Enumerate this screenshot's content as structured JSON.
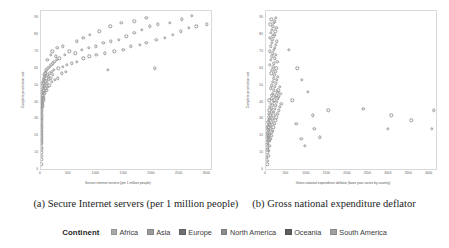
{
  "figure": {
    "captions": [
      "(a) Secure Internet servers (per 1 million people)",
      "(b) Gross national expenditure deflator"
    ]
  },
  "legend": {
    "title": "Continent",
    "items": [
      {
        "label": "Africa",
        "color": "#a9a9a9"
      },
      {
        "label": "Asia",
        "color": "#9b9b9b"
      },
      {
        "label": "Europe",
        "color": "#6f6f6f"
      },
      {
        "label": "North America",
        "color": "#8c8c8c"
      },
      {
        "label": "Oceania",
        "color": "#5e5e5e"
      },
      {
        "label": "South America",
        "color": "#a0a0a0"
      }
    ]
  },
  "chart_data": [
    {
      "type": "scatter",
      "panel": "a",
      "title": "",
      "xlabel": "Secure internet servers (per 1 million people)",
      "ylabel": "Complete penetration rate",
      "xlim": [
        0,
        3100
      ],
      "ylim": [
        0,
        95
      ],
      "xticks": [
        0,
        500,
        1000,
        1500,
        2000,
        2500,
        3000
      ],
      "xticklabels": [
        "0",
        "500",
        "1000",
        "1500",
        "2000",
        "2500",
        "3000"
      ],
      "yticks": [
        0,
        10,
        20,
        30,
        40,
        50,
        60,
        70,
        80,
        90
      ],
      "yticklabels": [
        "0",
        "10",
        "20",
        "30",
        "40",
        "50",
        "60",
        "70",
        "80",
        "90"
      ],
      "grid": false,
      "marker": "open-circle",
      "points": [
        [
          5,
          4
        ],
        [
          5,
          7
        ],
        [
          5,
          9
        ],
        [
          6,
          11
        ],
        [
          5,
          13
        ],
        [
          7,
          14
        ],
        [
          6,
          16
        ],
        [
          8,
          17
        ],
        [
          5,
          18
        ],
        [
          9,
          19
        ],
        [
          7,
          20
        ],
        [
          6,
          21
        ],
        [
          10,
          22
        ],
        [
          8,
          23
        ],
        [
          12,
          24
        ],
        [
          7,
          25
        ],
        [
          11,
          26
        ],
        [
          9,
          27
        ],
        [
          14,
          28
        ],
        [
          8,
          29
        ],
        [
          13,
          30
        ],
        [
          10,
          31
        ],
        [
          16,
          32
        ],
        [
          12,
          33
        ],
        [
          9,
          34
        ],
        [
          18,
          35
        ],
        [
          14,
          36
        ],
        [
          11,
          37
        ],
        [
          20,
          38
        ],
        [
          15,
          38
        ],
        [
          24,
          39
        ],
        [
          13,
          40
        ],
        [
          28,
          40
        ],
        [
          18,
          41
        ],
        [
          34,
          41
        ],
        [
          16,
          42
        ],
        [
          40,
          42
        ],
        [
          22,
          43
        ],
        [
          46,
          43
        ],
        [
          19,
          44
        ],
        [
          52,
          44
        ],
        [
          26,
          45
        ],
        [
          30,
          46
        ],
        [
          60,
          46
        ],
        [
          24,
          47
        ],
        [
          70,
          47
        ],
        [
          38,
          48
        ],
        [
          100,
          48
        ],
        [
          33,
          49
        ],
        [
          86,
          49
        ],
        [
          46,
          50
        ],
        [
          120,
          50
        ],
        [
          28,
          51
        ],
        [
          64,
          51
        ],
        [
          150,
          51
        ],
        [
          42,
          52
        ],
        [
          108,
          52
        ],
        [
          36,
          53
        ],
        [
          78,
          53
        ],
        [
          200,
          53
        ],
        [
          55,
          54
        ],
        [
          130,
          54
        ],
        [
          245,
          54
        ],
        [
          50,
          55
        ],
        [
          95,
          55
        ],
        [
          175,
          55
        ],
        [
          300,
          55
        ],
        [
          66,
          56
        ],
        [
          140,
          56
        ],
        [
          58,
          57
        ],
        [
          112,
          57
        ],
        [
          215,
          57
        ],
        [
          74,
          58
        ],
        [
          160,
          58
        ],
        [
          380,
          58
        ],
        [
          88,
          59
        ],
        [
          190,
          59
        ],
        [
          450,
          59
        ],
        [
          96,
          60
        ],
        [
          230,
          60
        ],
        [
          1200,
          60
        ],
        [
          125,
          61
        ],
        [
          310,
          61
        ],
        [
          2050,
          61
        ],
        [
          155,
          62
        ],
        [
          390,
          62
        ],
        [
          185,
          63
        ],
        [
          470,
          63
        ],
        [
          210,
          64
        ],
        [
          560,
          64
        ],
        [
          240,
          65
        ],
        [
          650,
          65
        ],
        [
          115,
          66
        ],
        [
          280,
          66
        ],
        [
          330,
          67
        ],
        [
          760,
          67
        ],
        [
          265,
          68
        ],
        [
          870,
          68
        ],
        [
          180,
          69
        ],
        [
          430,
          69
        ],
        [
          1000,
          69
        ],
        [
          620,
          70
        ],
        [
          1150,
          70
        ],
        [
          205,
          71
        ],
        [
          510,
          71
        ],
        [
          1320,
          71
        ],
        [
          730,
          72
        ],
        [
          1480,
          72
        ],
        [
          295,
          73
        ],
        [
          860,
          73
        ],
        [
          1620,
          74
        ],
        [
          390,
          74
        ],
        [
          990,
          74
        ],
        [
          1780,
          75
        ],
        [
          1120,
          76
        ],
        [
          1900,
          76
        ],
        [
          640,
          77
        ],
        [
          1260,
          77
        ],
        [
          2080,
          78
        ],
        [
          1400,
          78
        ],
        [
          760,
          79
        ],
        [
          2230,
          79
        ],
        [
          1540,
          80
        ],
        [
          880,
          81
        ],
        [
          2380,
          81
        ],
        [
          1680,
          82
        ],
        [
          1050,
          83
        ],
        [
          2520,
          83
        ],
        [
          1820,
          84
        ],
        [
          2660,
          85
        ],
        [
          1250,
          86
        ],
        [
          1960,
          86
        ],
        [
          2800,
          86
        ],
        [
          2100,
          87
        ],
        [
          1450,
          88
        ],
        [
          2320,
          88
        ],
        [
          2990,
          87
        ],
        [
          1680,
          89
        ],
        [
          2540,
          90
        ],
        [
          1900,
          91
        ],
        [
          2720,
          92
        ]
      ]
    },
    {
      "type": "scatter",
      "panel": "b",
      "title": "",
      "xlabel": "Gross national expenditure deflator (base year varies by country)",
      "ylabel": "Complete penetration rate",
      "xlim": [
        0,
        4200
      ],
      "ylim": [
        0,
        95
      ],
      "xticks": [
        0,
        500,
        1000,
        1500,
        2000,
        2500,
        3000,
        3500,
        4000
      ],
      "xticklabels": [
        "0",
        "500",
        "1000",
        "1500",
        "2000",
        "2500",
        "3000",
        "3500",
        "4000"
      ],
      "yticks": [
        0,
        10,
        20,
        30,
        40,
        50,
        60,
        70,
        80,
        90
      ],
      "yticklabels": [
        "0",
        "10",
        "20",
        "30",
        "40",
        "50",
        "60",
        "70",
        "80",
        "90"
      ],
      "grid": false,
      "marker": "open-circle",
      "points": [
        [
          30,
          4
        ],
        [
          40,
          6
        ],
        [
          25,
          8
        ],
        [
          55,
          9
        ],
        [
          35,
          11
        ],
        [
          70,
          12
        ],
        [
          45,
          13
        ],
        [
          28,
          14
        ],
        [
          85,
          15
        ],
        [
          50,
          16
        ],
        [
          33,
          17
        ],
        [
          95,
          18
        ],
        [
          60,
          18
        ],
        [
          38,
          19
        ],
        [
          110,
          19
        ],
        [
          42,
          20
        ],
        [
          75,
          20
        ],
        [
          125,
          21
        ],
        [
          55,
          21
        ],
        [
          30,
          22
        ],
        [
          90,
          22
        ],
        [
          140,
          23
        ],
        [
          48,
          23
        ],
        [
          160,
          24
        ],
        [
          68,
          24
        ],
        [
          36,
          25
        ],
        [
          105,
          25
        ],
        [
          180,
          26
        ],
        [
          58,
          26
        ],
        [
          44,
          27
        ],
        [
          120,
          27
        ],
        [
          200,
          28
        ],
        [
          78,
          28
        ],
        [
          52,
          29
        ],
        [
          135,
          29
        ],
        [
          225,
          30
        ],
        [
          66,
          30
        ],
        [
          95,
          31
        ],
        [
          155,
          31
        ],
        [
          250,
          32
        ],
        [
          74,
          32
        ],
        [
          110,
          33
        ],
        [
          175,
          33
        ],
        [
          280,
          34
        ],
        [
          62,
          34
        ],
        [
          128,
          35
        ],
        [
          195,
          35
        ],
        [
          310,
          36
        ],
        [
          85,
          36
        ],
        [
          145,
          37
        ],
        [
          215,
          37
        ],
        [
          340,
          38
        ],
        [
          98,
          38
        ],
        [
          165,
          39
        ],
        [
          240,
          39
        ],
        [
          375,
          40
        ],
        [
          112,
          40
        ],
        [
          185,
          41
        ],
        [
          265,
          41
        ],
        [
          80,
          42
        ],
        [
          205,
          42
        ],
        [
          290,
          43
        ],
        [
          130,
          43
        ],
        [
          225,
          44
        ],
        [
          320,
          44
        ],
        [
          148,
          45
        ],
        [
          250,
          45
        ],
        [
          350,
          46
        ],
        [
          170,
          46
        ],
        [
          275,
          47
        ],
        [
          190,
          48
        ],
        [
          300,
          48
        ],
        [
          115,
          49
        ],
        [
          215,
          50
        ],
        [
          330,
          50
        ],
        [
          138,
          51
        ],
        [
          240,
          52
        ],
        [
          160,
          53
        ],
        [
          265,
          54
        ],
        [
          185,
          55
        ],
        [
          290,
          56
        ],
        [
          205,
          57
        ],
        [
          125,
          58
        ],
        [
          230,
          59
        ],
        [
          150,
          60
        ],
        [
          255,
          61
        ],
        [
          175,
          62
        ],
        [
          100,
          63
        ],
        [
          195,
          64
        ],
        [
          280,
          65
        ],
        [
          120,
          66
        ],
        [
          215,
          67
        ],
        [
          140,
          68
        ],
        [
          240,
          69
        ],
        [
          165,
          70
        ],
        [
          90,
          71
        ],
        [
          190,
          72
        ],
        [
          215,
          73
        ],
        [
          110,
          74
        ],
        [
          240,
          75
        ],
        [
          135,
          76
        ],
        [
          265,
          77
        ],
        [
          155,
          78
        ],
        [
          95,
          79
        ],
        [
          180,
          80
        ],
        [
          205,
          81
        ],
        [
          120,
          82
        ],
        [
          230,
          83
        ],
        [
          145,
          84
        ],
        [
          255,
          85
        ],
        [
          170,
          86
        ],
        [
          105,
          87
        ],
        [
          195,
          88
        ],
        [
          220,
          89
        ],
        [
          130,
          90
        ],
        [
          245,
          91
        ],
        [
          560,
          72
        ],
        [
          760,
          61
        ],
        [
          880,
          54
        ],
        [
          1020,
          47
        ],
        [
          1180,
          25
        ],
        [
          860,
          19
        ],
        [
          740,
          28
        ],
        [
          1520,
          36
        ],
        [
          2380,
          37
        ],
        [
          3060,
          33
        ],
        [
          3550,
          30
        ],
        [
          4090,
          36
        ],
        [
          4050,
          25
        ],
        [
          2980,
          25
        ],
        [
          1320,
          20
        ],
        [
          950,
          15
        ],
        [
          640,
          42
        ],
        [
          1140,
          33
        ]
      ]
    }
  ]
}
